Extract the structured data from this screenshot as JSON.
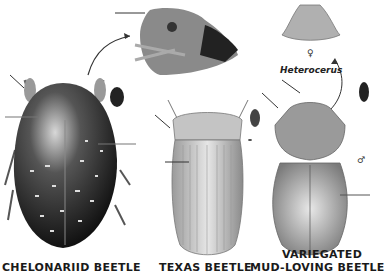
{
  "plate": {
    "subjects": [
      {
        "id": "chelonariid",
        "caption": "CHELONARIID BEETLE"
      },
      {
        "id": "texas",
        "caption": "TEXAS BEETLE"
      },
      {
        "id": "variegated",
        "caption_line1": "VARIEGATED",
        "caption_line2": "MUD-LOVING BEETLE"
      }
    ],
    "genus_label": "Heterocerus",
    "female_symbol": "♀",
    "male_symbol": "♂"
  }
}
